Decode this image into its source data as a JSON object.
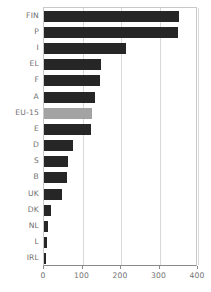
{
  "chart_data": {
    "type": "bar",
    "orientation": "horizontal",
    "title": "",
    "subtitle": "",
    "xlabel": "",
    "ylabel": "",
    "xlim": [
      0,
      400
    ],
    "xticks": [
      0,
      100,
      200,
      300,
      400
    ],
    "xtick_labels": [
      "0",
      "100",
      "200",
      "300",
      "400"
    ],
    "grid": true,
    "grid_axis": "x",
    "legend": false,
    "legend_position": "none",
    "categories": [
      "FIN",
      "P",
      "I",
      "EL",
      "F",
      "A",
      "EU-15",
      "E",
      "D",
      "S",
      "B",
      "UK",
      "DK",
      "NL",
      "L",
      "IRL"
    ],
    "values": [
      350,
      348,
      213,
      148,
      145,
      132,
      125,
      122,
      75,
      63,
      60,
      47,
      18,
      11,
      7,
      4
    ],
    "highlight_category": "EU-15",
    "colors": {
      "bar": "#262626",
      "bar_highlight": "#a3a3a3",
      "grid": "#d8d8d8",
      "axis": "#8a8a8a",
      "frame": "#c9c9c9",
      "text": "#6f6f6f",
      "background": "#ffffff"
    },
    "bars": [
      {
        "label": "FIN",
        "value": 350,
        "highlight": false
      },
      {
        "label": "P",
        "value": 348,
        "highlight": false
      },
      {
        "label": "I",
        "value": 213,
        "highlight": false
      },
      {
        "label": "EL",
        "value": 148,
        "highlight": false
      },
      {
        "label": "F",
        "value": 145,
        "highlight": false
      },
      {
        "label": "A",
        "value": 132,
        "highlight": false
      },
      {
        "label": "EU-15",
        "value": 125,
        "highlight": true
      },
      {
        "label": "E",
        "value": 122,
        "highlight": false
      },
      {
        "label": "D",
        "value": 75,
        "highlight": false
      },
      {
        "label": "S",
        "value": 63,
        "highlight": false
      },
      {
        "label": "B",
        "value": 60,
        "highlight": false
      },
      {
        "label": "UK",
        "value": 47,
        "highlight": false
      },
      {
        "label": "DK",
        "value": 18,
        "highlight": false
      },
      {
        "label": "NL",
        "value": 11,
        "highlight": false
      },
      {
        "label": "L",
        "value": 7,
        "highlight": false
      },
      {
        "label": "IRL",
        "value": 4,
        "highlight": false
      }
    ]
  }
}
